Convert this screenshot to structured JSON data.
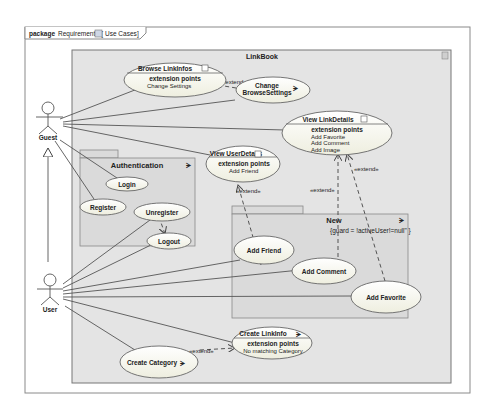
{
  "frame": {
    "keyword": "package",
    "name": "Requirements",
    "diagram_label": "Use Cases"
  },
  "system": {
    "name": "LinkBook"
  },
  "packages": {
    "authentication": {
      "name": "Authentication"
    },
    "new": {
      "name": "New",
      "guard": "{guard = !activeUser!=null\" }"
    }
  },
  "actors": {
    "guest": "Guest",
    "user": "User"
  },
  "use_cases": {
    "browse_linkinfos": {
      "name": "Browse LinkInfos",
      "ext_header": "extension points",
      "ext": [
        "Change Settings"
      ]
    },
    "change_browse_settings": {
      "line1": "Change",
      "line2": "BrowseSettings"
    },
    "view_linkdetails": {
      "name": "View LinkDetails",
      "ext_header": "extension points",
      "ext": [
        "Add Favorite",
        "Add Comment",
        "Add Image"
      ]
    },
    "view_userdetails": {
      "name": "View UserDetails",
      "ext_header": "extension points",
      "ext": [
        "Add Friend"
      ]
    },
    "login": {
      "name": "Login"
    },
    "register": {
      "name": "Register"
    },
    "unregister": {
      "name": "Unregister"
    },
    "logout": {
      "name": "Logout"
    },
    "add_friend": {
      "name": "Add Friend"
    },
    "add_comment": {
      "name": "Add Comment"
    },
    "add_favorite": {
      "name": "Add Favorite"
    },
    "create_linkinfo": {
      "name": "Create LinkInfo",
      "ext_header": "extension points",
      "ext": [
        "No matching Category"
      ]
    },
    "create_category": {
      "name": "Create Category"
    }
  },
  "relations": {
    "extend": "«extend»"
  },
  "colors": {
    "system_fill": "#e4e4e4",
    "package_fill": "#dcdcdc",
    "usecase_fill": "#fbfbf3",
    "line": "#555555"
  }
}
